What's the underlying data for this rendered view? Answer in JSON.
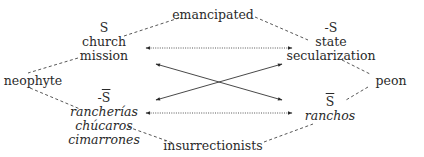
{
  "diagram": {
    "type": "semiotic-square",
    "top_term": "emancipated",
    "bottom_term": "insurrectionists",
    "left_term": "neophyte",
    "right_term": "peon",
    "top_left": {
      "symbol_prefix": "",
      "symbol": "S",
      "symbol_overline": false,
      "lines": [
        "church",
        "mission"
      ],
      "italic": false
    },
    "top_right": {
      "symbol_prefix": "-",
      "symbol": "S",
      "symbol_overline": false,
      "lines": [
        "state",
        "secularization"
      ],
      "italic": false
    },
    "bottom_left": {
      "symbol_prefix": "-",
      "symbol": "S",
      "symbol_overline": true,
      "lines": [
        "rancherías",
        "chúcaros",
        "cimarrones"
      ],
      "italic": true
    },
    "bottom_right": {
      "symbol_prefix": "",
      "symbol": "S",
      "symbol_overline": true,
      "lines": [
        "ranchos"
      ],
      "italic": true
    },
    "relations": [
      {
        "from": "top_left",
        "to": "top_right",
        "style": "dotted",
        "heads": "both"
      },
      {
        "from": "bottom_left",
        "to": "bottom_right",
        "style": "dotted",
        "heads": "both"
      },
      {
        "from": "top_left",
        "to": "bottom_right",
        "style": "solid",
        "heads": "both"
      },
      {
        "from": "bottom_left",
        "to": "top_right",
        "style": "solid",
        "heads": "both"
      },
      {
        "from": "top_left",
        "to": "top_term",
        "style": "dashed",
        "heads": "none"
      },
      {
        "from": "top_right",
        "to": "top_term",
        "style": "dashed",
        "heads": "none"
      },
      {
        "from": "top_left",
        "to": "left_term",
        "style": "dashed",
        "heads": "none"
      },
      {
        "from": "bottom_left",
        "to": "left_term",
        "style": "dashed",
        "heads": "none"
      },
      {
        "from": "top_right",
        "to": "right_term",
        "style": "dashed",
        "heads": "none"
      },
      {
        "from": "bottom_right",
        "to": "right_term",
        "style": "dashed",
        "heads": "none"
      },
      {
        "from": "bottom_left",
        "to": "bottom_term",
        "style": "dashed",
        "heads": "none"
      },
      {
        "from": "bottom_right",
        "to": "bottom_term",
        "style": "dashed",
        "heads": "none"
      }
    ],
    "colors": {
      "text": "#2a2a2a",
      "line": "#333333"
    }
  }
}
